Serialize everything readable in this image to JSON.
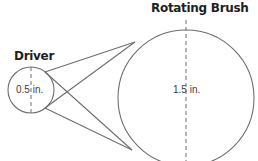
{
  "labels": {
    "driver": "Driver",
    "brush": "Rotating Brush",
    "driver_diameter": "0.5 in.",
    "brush_diameter": "1.5 in."
  },
  "colors": {
    "stroke": "#6d6e71",
    "text": "#231f20"
  },
  "geometry": {
    "driver_circle": {
      "cx": 31,
      "cy": 90,
      "r": 23
    },
    "brush_circle": {
      "cx": 186,
      "cy": 98,
      "r": 68
    },
    "belt": "crossed"
  }
}
